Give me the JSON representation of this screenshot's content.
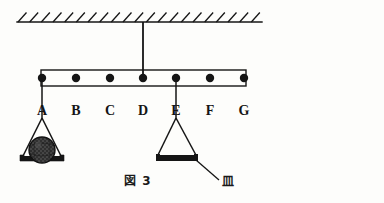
{
  "figure": {
    "caption": "図 3",
    "pan_label": "皿",
    "ceiling": {
      "name": "hatched-ceiling",
      "x_start": 17,
      "x_end": 262,
      "y": 22,
      "hatch_count": 21
    },
    "support_rod": {
      "x": 143,
      "y_top": 22,
      "y_bottom": 78
    },
    "beam": {
      "x_start": 41,
      "x_end": 246,
      "y_top": 70,
      "y_bottom": 86
    },
    "points": [
      {
        "label": "A",
        "x": 42,
        "y": 78
      },
      {
        "label": "B",
        "x": 76,
        "y": 78
      },
      {
        "label": "C",
        "x": 110,
        "y": 78
      },
      {
        "label": "D",
        "x": 143,
        "y": 78
      },
      {
        "label": "E",
        "x": 176,
        "y": 78
      },
      {
        "label": "F",
        "x": 210,
        "y": 78
      },
      {
        "label": "G",
        "x": 244,
        "y": 78
      }
    ],
    "label_y": 104,
    "left_pan": {
      "name": "pan-with-weight",
      "attach_x": 42,
      "attach_y": 78,
      "apex_y": 118,
      "left_x": 22,
      "right_x": 62,
      "pan_y": 160,
      "has_weight": true
    },
    "right_pan": {
      "name": "empty-pan",
      "attach_x": 176,
      "attach_y": 78,
      "apex_y": 118,
      "left_x": 156,
      "right_x": 198,
      "pan_y": 160,
      "has_weight": false
    },
    "weight_ball": {
      "cx": 42,
      "cy": 150,
      "r": 13
    },
    "leader_line": {
      "x1": 196,
      "y1": 160,
      "x2": 219,
      "y2": 180
    },
    "caption_pos": {
      "x": 124,
      "y": 175
    },
    "pan_label_pos": {
      "x": 222,
      "y": 176
    },
    "colors": {
      "ink": "#151515",
      "paper": "#fdfdfb",
      "ball_fill": "#3a3a3a"
    }
  }
}
